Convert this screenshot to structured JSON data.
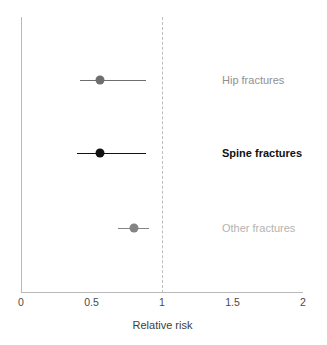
{
  "chart_data": {
    "type": "scatter",
    "subtype": "forest-plot",
    "title": "",
    "xlabel": "Relative risk",
    "ylabel": "",
    "xlim": [
      0,
      2
    ],
    "xticks": [
      0,
      0.5,
      1,
      1.5,
      2
    ],
    "xtick_labels": [
      "0",
      "0.5",
      "1",
      "1.5",
      "2"
    ],
    "grid": false,
    "legend": "none",
    "reference_line": {
      "name": "null-effect-line",
      "value": 1,
      "style": "dashed",
      "color": "#bdbdbd"
    },
    "categories": [
      "Hip fractures",
      "Spine fractures",
      "Other fractures"
    ],
    "rows": [
      {
        "label": "Hip fractures",
        "estimate": 0.56,
        "ci_low": 0.42,
        "ci_high": 0.89,
        "color": "#6e6e6e",
        "label_color": "#909090",
        "label_weight": "normal"
      },
      {
        "label": "Spine fractures",
        "estimate": 0.56,
        "ci_low": 0.4,
        "ci_high": 0.89,
        "color": "#111111",
        "label_color": "#111111",
        "label_weight": "bold"
      },
      {
        "label": "Other fractures",
        "estimate": 0.8,
        "ci_low": 0.69,
        "ci_high": 0.91,
        "color": "#848484",
        "label_color": "#b3b3b3",
        "label_weight": "normal"
      }
    ]
  },
  "colors": {
    "axis": "#b9b9b9",
    "tick_text": "#4a4a4a",
    "axis_title": "#3d3d3d",
    "background": "#ffffff"
  },
  "axis_title": "Relative risk"
}
